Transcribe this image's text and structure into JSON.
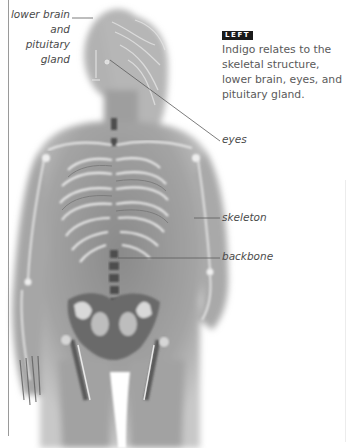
{
  "figure": {
    "colors": {
      "body_tone": "#9c9c9c",
      "body_light": "#c4c4c4",
      "bone_highlight": "#efefef",
      "bone_shadow": "#555555",
      "leader_line": "#5a5a5a",
      "page_rule": "#9a9a9a"
    }
  },
  "labels": {
    "brain": [
      "lower brain",
      "and",
      "pituitary",
      "gland"
    ],
    "eyes": "eyes",
    "skeleton": "skeleton",
    "backbone": "backbone"
  },
  "caption": {
    "badge": "LEFT",
    "badge_bg": "#1a1a1a",
    "lines": [
      "Indigo relates to the",
      "skeletal structure,",
      "lower brain, eyes, and",
      "pituitary gland."
    ]
  }
}
